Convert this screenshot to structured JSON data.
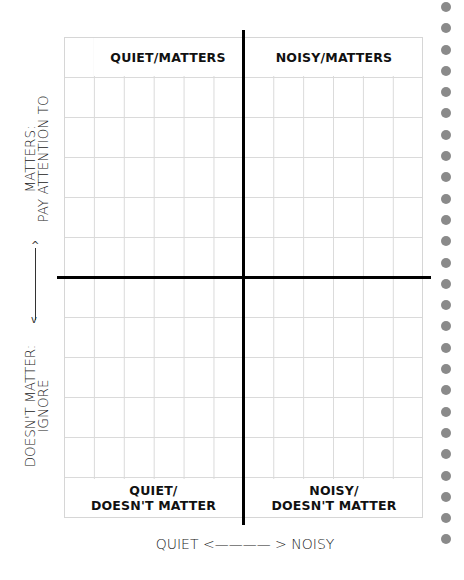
{
  "quadrants": {
    "top_left": "QUIET/MATTERS",
    "top_right": "NOISY/MATTERS",
    "bottom_left": {
      "line1": "QUIET/",
      "line2": "DOESN'T MATTER"
    },
    "bottom_right": {
      "line1": "NOISY/",
      "line2": "DOESN'T MATTER"
    }
  },
  "y_axis": {
    "top": {
      "line1": "MATTERS:",
      "line2": "PAY ATTENTION TO"
    },
    "bottom": {
      "line1": "DOESN'T MATTER:",
      "line2": "IGNORE"
    },
    "arrow_up": "^",
    "arrow_down": "v"
  },
  "x_axis": {
    "label": "QUIET <———— > NOISY"
  },
  "grid": {
    "rows": 12,
    "columns": 12,
    "line_color": "#dadada"
  },
  "decorations": {
    "dot_count": 26,
    "dot_color": "#8a8a8a"
  }
}
